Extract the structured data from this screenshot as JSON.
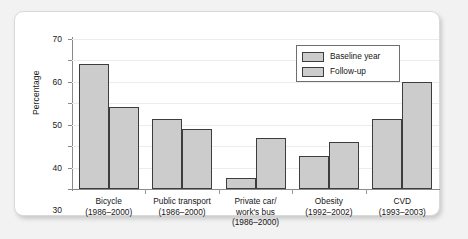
{
  "chart_data": {
    "type": "bar",
    "title": "",
    "xlabel": "",
    "ylabel": "Percentage",
    "ylim": [
      0,
      70
    ],
    "yticks": [
      0,
      10,
      20,
      30,
      40,
      50,
      60,
      70
    ],
    "grid": true,
    "legend_position": "top-right",
    "categories": [
      "Bicycle\n(1986–2000)",
      "Public transport\n(1986–2000)",
      "Private car/\nwork's bus\n(1986–2000)",
      "Obesity\n(1992–2002)",
      "CVD\n(1993–2003)"
    ],
    "category_lines": [
      [
        "Bicycle",
        "(1986–2000)"
      ],
      [
        "Public transport",
        "(1986–2000)"
      ],
      [
        "Private car/",
        "work's bus",
        "(1986–2000)"
      ],
      [
        "Obesity",
        "(1992–2002)"
      ],
      [
        "CVD",
        "(1993–2003)"
      ]
    ],
    "series": [
      {
        "name": "Baseline year",
        "values": [
          58.5,
          32.5,
          5,
          15.5,
          32.5
        ]
      },
      {
        "name": "Follow-up",
        "values": [
          38.5,
          28,
          24,
          22,
          50
        ]
      }
    ],
    "colors": {
      "bar_fill": "#cccccc",
      "bar_border": "#3d3d3d",
      "axis": "#8a8a8a",
      "grid": "#ececec",
      "text": "#151515",
      "panel": "#ffffff",
      "background": "#f2f2f2"
    }
  },
  "legend": {
    "items": [
      {
        "label": "Baseline year"
      },
      {
        "label": "Follow-up"
      }
    ]
  }
}
